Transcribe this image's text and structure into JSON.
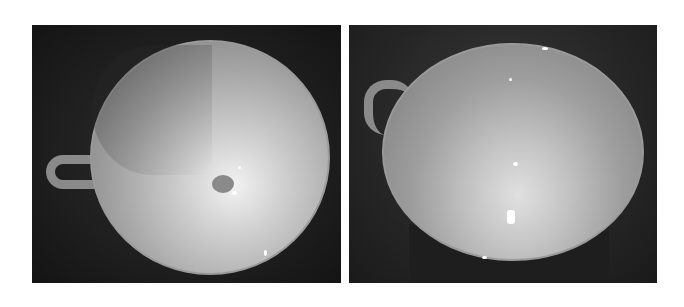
{
  "figure": {
    "panels": [
      {
        "id": "left",
        "subject": "teacup-top-view",
        "tone": "grayscale"
      },
      {
        "id": "right",
        "subject": "teacup-angled-view",
        "tone": "grayscale"
      }
    ],
    "colors": {
      "background": "#ffffff",
      "photo_dark": "#1c1c1c",
      "cup_light": "#d8d8d8"
    }
  }
}
